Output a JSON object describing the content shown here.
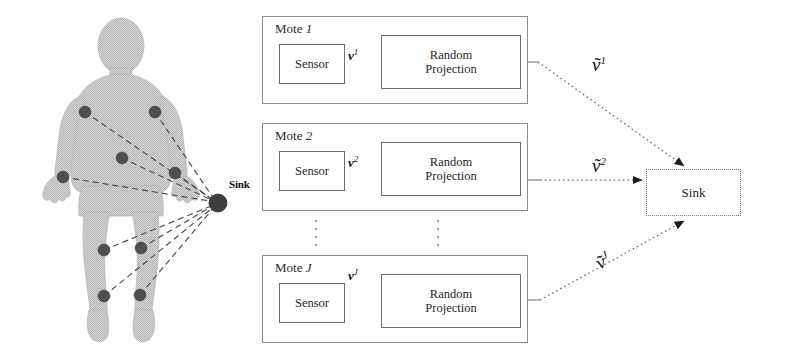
{
  "figure": {
    "background_color": "#ffffff",
    "body_fill": "#c9c9c9",
    "node_color": "#4a4a4a",
    "line_color": "#5a5a5a"
  },
  "body_panel": {
    "sink_node_label": "Sink",
    "sensor_nodes": [
      {
        "name": "left-shoulder-node",
        "cx": 85,
        "cy": 112
      },
      {
        "name": "right-shoulder-node",
        "cx": 155,
        "cy": 112
      },
      {
        "name": "waist-node",
        "cx": 122,
        "cy": 158
      },
      {
        "name": "left-wrist-node",
        "cx": 63,
        "cy": 177
      },
      {
        "name": "right-hip-node",
        "cx": 175,
        "cy": 173
      },
      {
        "name": "left-knee-node",
        "cx": 104,
        "cy": 250
      },
      {
        "name": "right-knee-node",
        "cx": 141,
        "cy": 248
      },
      {
        "name": "left-ankle-node",
        "cx": 104,
        "cy": 296
      },
      {
        "name": "right-ankle-node",
        "cx": 140,
        "cy": 295
      }
    ],
    "sink_node": {
      "cx": 218,
      "cy": 203,
      "r": 9
    }
  },
  "motes": [
    {
      "id": "mote-1",
      "title_prefix": "Mote",
      "title_index": "1",
      "sensor_label": "Sensor",
      "projection_label_line1": "Random",
      "projection_label_line2": "Projection",
      "internal_signal": "v",
      "internal_signal_sup": "1",
      "output_signal": "ṽ",
      "output_signal_sup": "1"
    },
    {
      "id": "mote-2",
      "title_prefix": "Mote",
      "title_index": "2",
      "sensor_label": "Sensor",
      "projection_label_line1": "Random",
      "projection_label_line2": "Projection",
      "internal_signal": "v",
      "internal_signal_sup": "2",
      "output_signal": "ṽ",
      "output_signal_sup": "2"
    },
    {
      "id": "mote-j",
      "title_prefix": "Mote",
      "title_index": "J",
      "sensor_label": "Sensor",
      "projection_label_line1": "Random",
      "projection_label_line2": "Projection",
      "internal_signal": "v",
      "internal_signal_sup": "J",
      "output_signal": "ṽ",
      "output_signal_sup": "J"
    }
  ],
  "sink": {
    "label": "Sink"
  }
}
